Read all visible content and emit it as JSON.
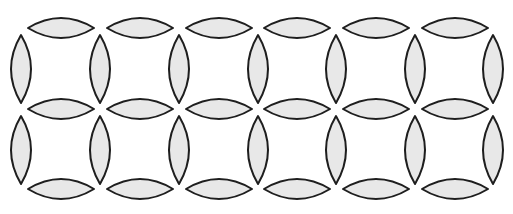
{
  "diagram": {
    "title": "",
    "width": 513,
    "height": 214,
    "background": "#ffffff",
    "leaf_fill": "#e8e8e8",
    "leaf_stroke": "#1e1e1e",
    "pitch_x": 78.7,
    "horizontal_leaves": {
      "half_length": 33,
      "half_width": 10,
      "x_centers": [
        61,
        140,
        219,
        297,
        376,
        455
      ],
      "y_centers": [
        28,
        109,
        189
      ]
    },
    "vertical_leaves": {
      "half_length": 34,
      "half_width": 10,
      "x_centers": [
        21,
        100,
        179,
        258,
        336,
        415,
        493
      ],
      "y_centers": [
        69,
        150
      ]
    },
    "grid": {
      "columns": 6,
      "rows": 2,
      "description": "Lattice of lens-shaped (vesica) leaves forming 6×2 square cells"
    }
  }
}
